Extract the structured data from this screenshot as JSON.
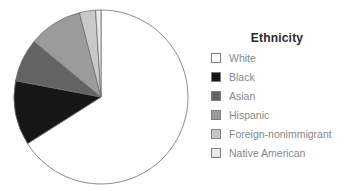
{
  "chart_data": {
    "type": "pie",
    "title": "Ethnicity",
    "legend_position": "right",
    "start_angle_deg": 90,
    "direction": "clockwise",
    "categories": [
      "White",
      "Black",
      "Asian",
      "Hispanic",
      "Foreign-nonimmigrant",
      "Native American"
    ],
    "values": [
      66,
      12,
      8,
      10,
      3,
      1
    ],
    "colors": [
      "#ffffff",
      "#161616",
      "#636363",
      "#9b9b9b",
      "#c9c9c9",
      "#e9e9e9"
    ],
    "outline_color": "#6f6f6f",
    "grid": false,
    "data_labels": false
  }
}
